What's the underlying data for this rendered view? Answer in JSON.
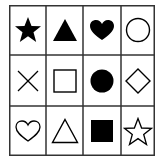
{
  "grid": {
    "rows": 3,
    "cols": 4,
    "line_color": "#333333",
    "fill_color": "#000000",
    "cells": [
      {
        "row": 0,
        "col": 0,
        "shape": "star",
        "style": "filled"
      },
      {
        "row": 0,
        "col": 1,
        "shape": "triangle",
        "style": "filled"
      },
      {
        "row": 0,
        "col": 2,
        "shape": "heart",
        "style": "filled"
      },
      {
        "row": 0,
        "col": 3,
        "shape": "circle",
        "style": "outline"
      },
      {
        "row": 1,
        "col": 0,
        "shape": "cross",
        "style": "outline"
      },
      {
        "row": 1,
        "col": 1,
        "shape": "square",
        "style": "outline"
      },
      {
        "row": 1,
        "col": 2,
        "shape": "circle",
        "style": "filled"
      },
      {
        "row": 1,
        "col": 3,
        "shape": "diamond",
        "style": "outline"
      },
      {
        "row": 2,
        "col": 0,
        "shape": "heart",
        "style": "outline"
      },
      {
        "row": 2,
        "col": 1,
        "shape": "triangle",
        "style": "outline"
      },
      {
        "row": 2,
        "col": 2,
        "shape": "square",
        "style": "filled"
      },
      {
        "row": 2,
        "col": 3,
        "shape": "star",
        "style": "outline"
      }
    ]
  }
}
